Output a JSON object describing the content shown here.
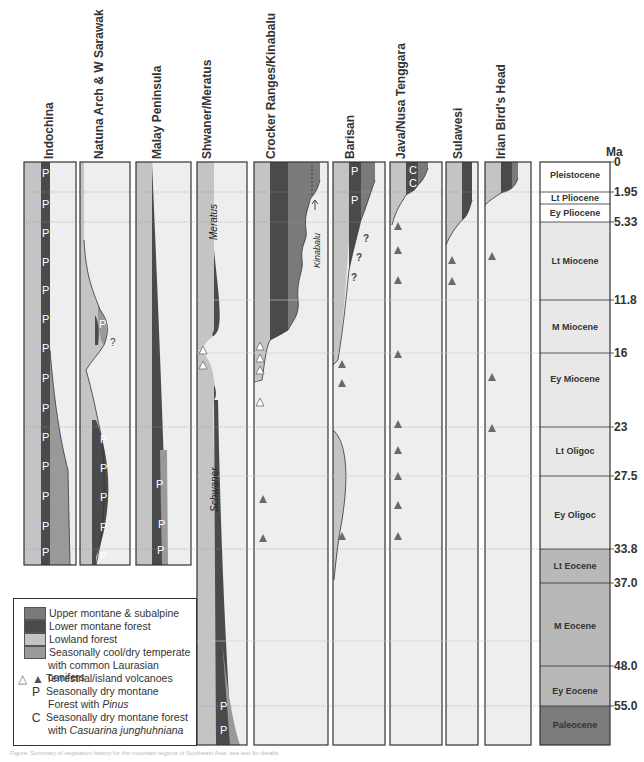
{
  "axis": {
    "unit_label": "Ma",
    "ticks": [
      "0",
      "1.95",
      "5.33",
      "11.8",
      "16",
      "23",
      "27.5",
      "33.8",
      "37.0",
      "48.0",
      "55.0"
    ]
  },
  "epochs": [
    {
      "label": "Pleistocene",
      "from": 0,
      "to": 1.95
    },
    {
      "label": "Lt Pliocene",
      "from": 1.95,
      "to": 3.6
    },
    {
      "label": "Ey Pliocene",
      "from": 3.6,
      "to": 5.33
    },
    {
      "label": "Lt Miocene",
      "from": 5.33,
      "to": 11.8
    },
    {
      "label": "M Miocene",
      "from": 11.8,
      "to": 16
    },
    {
      "label": "Ey Miocene",
      "from": 16,
      "to": 23
    },
    {
      "label": "Lt Oligoc",
      "from": 23,
      "to": 27.5
    },
    {
      "label": "Ey Oligoc",
      "from": 27.5,
      "to": 33.8
    },
    {
      "label": "Lt Eocene",
      "from": 33.8,
      "to": 37.0
    },
    {
      "label": "M Eocene",
      "from": 37.0,
      "to": 48.0
    },
    {
      "label": "Ey Eocene",
      "from": 48.0,
      "to": 55.0
    },
    {
      "label": "Paleocene",
      "from": 55.0,
      "to": 65
    }
  ],
  "columns": [
    {
      "name": "Indochina"
    },
    {
      "name": "Natuna Arch & W Sarawak",
      "annotation": "?"
    },
    {
      "name": "Malay Peninsula"
    },
    {
      "name": "Shwaner/Meratus",
      "labels": [
        "Meratus",
        "Schwaner"
      ]
    },
    {
      "name": "Crocker Ranges/Kinabalu",
      "labels": [
        "Kinabalu"
      ]
    },
    {
      "name": "Barisan",
      "annotations": [
        "?",
        "?",
        "?"
      ]
    },
    {
      "name": "Java/Nusa Tenggara"
    },
    {
      "name": "Sulawesi"
    },
    {
      "name": "Irian Bird's Head"
    }
  ],
  "markers": {
    "pinus": "P",
    "casuarina": "C"
  },
  "legend": {
    "items": [
      {
        "label": "Upper montane & subalpine",
        "color": "#7a7a7a"
      },
      {
        "label": "Lower montane forest",
        "color": "#4a4a4a"
      },
      {
        "label": "Lowland forest",
        "color": "#c4c4c4"
      },
      {
        "label": "Seasonally cool/dry temperate",
        "label2": "with common Laurasian conifers",
        "color": "#999999"
      }
    ],
    "volcano": {
      "symbol_open": "△",
      "symbol_filled": "▲",
      "label": "Terrestrial/island volcanoes"
    },
    "pinus": {
      "symbol": "P",
      "label": "Seasonally dry montane",
      "label2_prefix": "Forest with ",
      "label2_italic": "Pinus"
    },
    "casuarina": {
      "symbol": "C",
      "label": "Seasonally dry montane forest",
      "label2_prefix": "with ",
      "label2_italic": "Casuarina junghuhniana"
    }
  },
  "colors": {
    "upper_montane": "#7a7a7a",
    "lower_montane": "#4a4a4a",
    "lowland": "#c4c4c4",
    "temperate": "#999999",
    "background": "#eeeeee",
    "epoch_light": "#ffffff",
    "epoch_mid": "#e8e8e8",
    "epoch_eocene": "#b8b8b8",
    "epoch_paleocene": "#7c7c7c"
  },
  "caption": "Figure: Summary of vegetation history for the mountain regions of Southeast Asia; see text for details."
}
